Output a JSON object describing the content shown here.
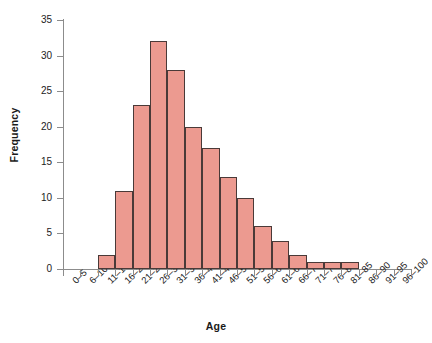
{
  "chart_data": {
    "type": "bar",
    "title": "",
    "xlabel": "Age",
    "ylabel": "Frequency",
    "categories": [
      "0–5",
      "6–10",
      "11–15",
      "16–20",
      "21–25",
      "26–30",
      "31–35",
      "36–40",
      "41–45",
      "46–50",
      "51–55",
      "56–60",
      "61–65",
      "66–70",
      "71–75",
      "76–80",
      "81–85",
      "86–90",
      "91–95",
      "96–100"
    ],
    "values": [
      0,
      0,
      2,
      11,
      23,
      32,
      28,
      20,
      17,
      13,
      10,
      6,
      4,
      2,
      1,
      1,
      1,
      0,
      0,
      0
    ],
    "ylim": [
      0,
      35
    ],
    "ytick_labels": [
      "0",
      "5",
      "10",
      "15",
      "20",
      "25",
      "30",
      "35"
    ],
    "ytick_values": [
      0,
      5,
      10,
      15,
      20,
      25,
      30,
      35
    ],
    "grid": false,
    "legend": "none",
    "bar_color": "#ec9a90",
    "bar_edge_color": "#4a3a38",
    "axis_color": "#8c8c8c",
    "xtick_label_rotation": -45
  }
}
